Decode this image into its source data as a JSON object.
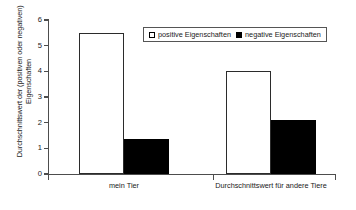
{
  "chart_data": {
    "type": "bar",
    "title": "",
    "xlabel": "",
    "ylabel_line1": "Durchschnittswert der (positiven oder negativen)",
    "ylabel_line2": "Eigenschaften",
    "categories": [
      "mein Tier",
      "Durchschnittswert für andere Tiere"
    ],
    "series": [
      {
        "name": "positive Eigenschaften",
        "color": "#ffffff",
        "values": [
          5.5,
          4.0
        ]
      },
      {
        "name": "negative Eigenschaften",
        "color": "#000000",
        "values": [
          1.35,
          2.1
        ]
      }
    ],
    "ylim": [
      0,
      6
    ],
    "yticks": [
      "0",
      "1",
      "2",
      "3",
      "4",
      "5",
      "6"
    ],
    "grid": false,
    "legend_position": "top-right"
  },
  "legend": {
    "entries": [
      {
        "label": "positive Eigenschaften",
        "swatch": "hollow-square-icon"
      },
      {
        "label": "negative Eigenschaften",
        "swatch": "filled-square-icon"
      }
    ]
  }
}
